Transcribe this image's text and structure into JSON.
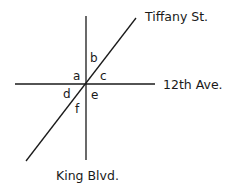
{
  "diagram": {
    "streets": {
      "diagonal": "Tiffany St.",
      "horizontal": "12th Ave.",
      "vertical": "King Blvd."
    },
    "angle_labels": [
      "a",
      "b",
      "c",
      "d",
      "e",
      "f"
    ],
    "colors": {
      "line": "#1a1a1a",
      "background": "#ffffff"
    }
  }
}
